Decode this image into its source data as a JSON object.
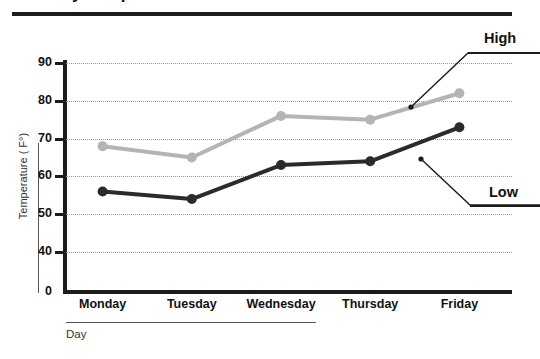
{
  "title": {
    "text": "Daily Temperatures",
    "visible_fragment": true
  },
  "axis": {
    "y_title": "Temperature ( F°)",
    "x_title": "Day"
  },
  "callouts": {
    "high": "High",
    "low": "Low"
  },
  "chart_data": {
    "type": "line",
    "title": "Daily Temperatures",
    "xlabel": "Day",
    "ylabel": "Temperature ( F°)",
    "categories": [
      "Monday",
      "Tuesday",
      "Wednesday",
      "Thursday",
      "Friday"
    ],
    "series": [
      {
        "name": "High",
        "color": "#b4b4b4",
        "values": [
          68,
          65,
          76,
          75,
          82
        ]
      },
      {
        "name": "Low",
        "color": "#2b2b2b",
        "values": [
          56,
          54,
          63,
          64,
          73
        ]
      }
    ],
    "ytick_labels": [
      "90",
      "80",
      "70",
      "60",
      "50",
      "40",
      "0"
    ],
    "ytick_values": [
      90,
      80,
      70,
      60,
      50,
      40,
      0
    ],
    "ylim": [
      36,
      92
    ],
    "axis_break": true,
    "grid": true,
    "grid_style": "dotted",
    "legend": "inline-callout",
    "legend_position": "right"
  }
}
